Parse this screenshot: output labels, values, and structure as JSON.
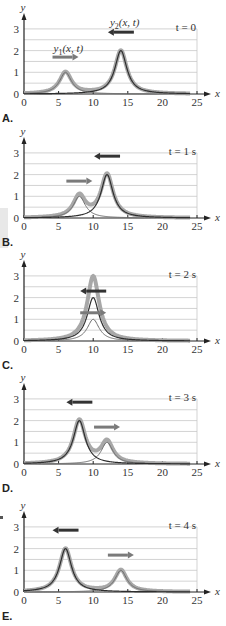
{
  "chart_data": [
    {
      "type": "line",
      "panel": "A.",
      "title": "t = 0",
      "xlabel": "x",
      "ylabel": "y",
      "xlim": [
        0,
        25
      ],
      "ylim": [
        0,
        3
      ],
      "xticks": [
        "0",
        "5",
        "10",
        "15",
        "20",
        "25"
      ],
      "yticks": [
        "0",
        "1",
        "2",
        "3"
      ],
      "grid": true,
      "series": [
        {
          "name": "y1(x, t)",
          "peak_x": 6,
          "amplitude": 1,
          "direction": "right"
        },
        {
          "name": "y2(x, t)",
          "peak_x": 14,
          "amplitude": 2,
          "direction": "left"
        },
        {
          "name": "sum",
          "style": "thick-gray"
        }
      ],
      "annotations": [
        "y1(x, t)",
        "y2(x, t)"
      ]
    },
    {
      "type": "line",
      "panel": "B.",
      "title": "t = 1 s",
      "xlabel": "x",
      "ylabel": "y",
      "xlim": [
        0,
        25
      ],
      "ylim": [
        0,
        3
      ],
      "xticks": [
        "0",
        "5",
        "10",
        "15",
        "20",
        "25"
      ],
      "yticks": [
        "0",
        "1",
        "2",
        "3"
      ],
      "grid": true,
      "series": [
        {
          "name": "y1(x, t)",
          "peak_x": 8,
          "amplitude": 1,
          "direction": "right"
        },
        {
          "name": "y2(x, t)",
          "peak_x": 12,
          "amplitude": 2,
          "direction": "left"
        },
        {
          "name": "sum",
          "style": "thick-gray"
        }
      ]
    },
    {
      "type": "line",
      "panel": "C.",
      "title": "t = 2 s",
      "xlabel": "x",
      "ylabel": "y",
      "xlim": [
        0,
        25
      ],
      "ylim": [
        0,
        3
      ],
      "xticks": [
        "0",
        "5",
        "10",
        "15",
        "20",
        "25"
      ],
      "yticks": [
        "0",
        "1",
        "2",
        "3"
      ],
      "grid": true,
      "series": [
        {
          "name": "y1(x, t)",
          "peak_x": 10,
          "amplitude": 1,
          "direction": "right"
        },
        {
          "name": "y2(x, t)",
          "peak_x": 10,
          "amplitude": 2,
          "direction": "left"
        },
        {
          "name": "sum",
          "peak_x": 10,
          "amplitude": 3,
          "style": "thick-gray"
        }
      ]
    },
    {
      "type": "line",
      "panel": "D.",
      "title": "t = 3 s",
      "xlabel": "x",
      "ylabel": "y",
      "xlim": [
        0,
        25
      ],
      "ylim": [
        0,
        3
      ],
      "xticks": [
        "0",
        "5",
        "10",
        "15",
        "20",
        "25"
      ],
      "yticks": [
        "0",
        "1",
        "2",
        "3"
      ],
      "grid": true,
      "series": [
        {
          "name": "y1(x, t)",
          "peak_x": 12,
          "amplitude": 1,
          "direction": "right"
        },
        {
          "name": "y2(x, t)",
          "peak_x": 8,
          "amplitude": 2,
          "direction": "left"
        },
        {
          "name": "sum",
          "style": "thick-gray"
        }
      ]
    },
    {
      "type": "line",
      "panel": "E.",
      "title": "t = 4 s",
      "xlabel": "x",
      "ylabel": "y",
      "xlim": [
        0,
        25
      ],
      "ylim": [
        0,
        3
      ],
      "xticks": [
        "0",
        "5",
        "10",
        "15",
        "20",
        "25"
      ],
      "yticks": [
        "0",
        "1",
        "2",
        "3"
      ],
      "grid": true,
      "series": [
        {
          "name": "y1(x, t)",
          "peak_x": 14,
          "amplitude": 1,
          "direction": "right"
        },
        {
          "name": "y2(x, t)",
          "peak_x": 6,
          "amplitude": 2,
          "direction": "left"
        },
        {
          "name": "sum",
          "style": "thick-gray"
        }
      ]
    }
  ],
  "labels": {
    "y1": "y",
    "y1_sub": "1",
    "y1_args": "(x, t)",
    "y2": "y",
    "y2_sub": "2",
    "y2_args": "(x, t)",
    "x_axis": "x",
    "y_axis": "y"
  },
  "colors": {
    "sum": "#a8a8a8",
    "y1": "#6e6e6e",
    "y2": "#2e2e2e",
    "arrow_right": "#7a7a7a",
    "arrow_left": "#333333",
    "grid": "#c8c8c8",
    "axis": "#222222"
  }
}
